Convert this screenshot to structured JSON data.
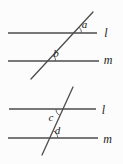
{
  "theme": {
    "background": "#fcfcfc",
    "line_color": "#4d4d4d",
    "arc_color": "#5a5a5a",
    "label_color": "#222222"
  },
  "figure_top": {
    "line_l_label": "l",
    "line_m_label": "m",
    "angle_at_l_label": "a",
    "angle_at_m_label": "b"
  },
  "figure_bottom": {
    "line_l_label": "l",
    "line_m_label": "m",
    "angle_at_l_label": "c",
    "angle_at_m_label": "d"
  }
}
